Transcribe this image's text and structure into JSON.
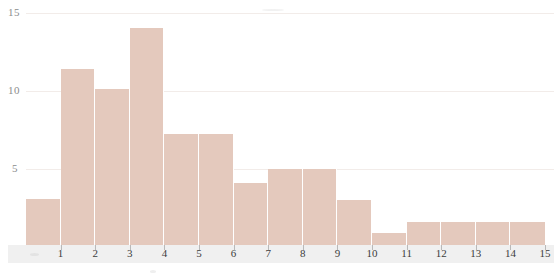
{
  "chart_data": {
    "type": "bar",
    "title": "",
    "subtitle": "",
    "xlabel": "",
    "ylabel": "",
    "xlim": [
      0,
      15
    ],
    "ylim": [
      0,
      15
    ],
    "grid": true,
    "legend": null,
    "legend_position": "none",
    "bar_color": "#e4c9bd",
    "gridline_color": "#f2ece9",
    "axis_strip_color": "#ededed",
    "tick_label_color": "#3c3c3c",
    "ytick_label_color": "#8c8c8c",
    "yticks": [
      {
        "label": "15",
        "value": 15
      },
      {
        "label": "10",
        "value": 10
      },
      {
        "label": "5",
        "value": 5
      }
    ],
    "xticks": [
      {
        "label": "1",
        "value": 1
      },
      {
        "label": "2",
        "value": 2
      },
      {
        "label": "3",
        "value": 3
      },
      {
        "label": "4",
        "value": 4
      },
      {
        "label": "5",
        "value": 5
      },
      {
        "label": "6",
        "value": 6
      },
      {
        "label": "7",
        "value": 7
      },
      {
        "label": "8",
        "value": 8
      },
      {
        "label": "9",
        "value": 9
      },
      {
        "label": "10",
        "value": 10
      },
      {
        "label": "11",
        "value": 11
      },
      {
        "label": "12",
        "value": 12
      },
      {
        "label": "13",
        "value": 13
      },
      {
        "label": "14",
        "value": 14
      },
      {
        "label": "15",
        "value": 15
      }
    ],
    "categories": [
      "0-1",
      "1-2",
      "2-3",
      "3-4",
      "4-5",
      "5-6",
      "6-7",
      "7-8",
      "8-9",
      "9-10",
      "10-11",
      "11-12",
      "12-13",
      "13-14",
      "14-15"
    ],
    "bin_edges": [
      0,
      1,
      2,
      3,
      4,
      5,
      6,
      7,
      8,
      9,
      10,
      11,
      12,
      13,
      14,
      15
    ],
    "values": [
      3,
      11.4,
      10.1,
      14,
      7.2,
      7.2,
      4,
      4.9,
      4.9,
      2.9,
      0.8,
      1.5,
      1.5,
      1.5,
      1.5
    ]
  }
}
